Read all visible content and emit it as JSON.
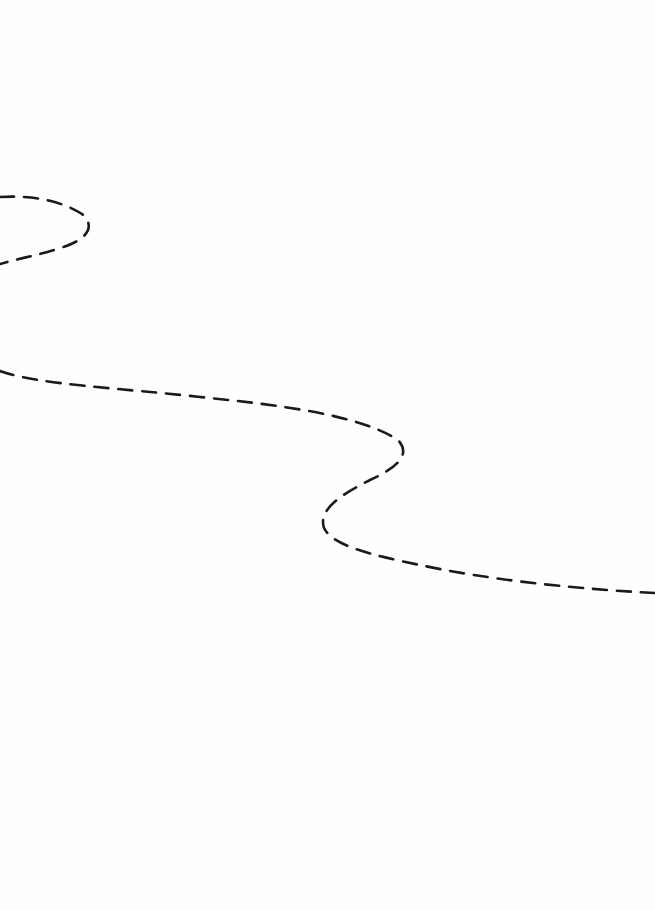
{
  "diagram": {
    "background": "#fefefe",
    "stroke_color": "#1a1a1a",
    "dash_pattern": "14 10",
    "curves": [
      {
        "name": "upper-left-loop",
        "path": "M 0 197 C 30 195, 60 200, 82 214 C 96 226, 88 240, 60 248 C 40 255, 20 258, 0 264"
      },
      {
        "name": "s-curve",
        "path": "M 0 371 C 40 385, 120 388, 200 397 C 280 405, 360 415, 398 440 C 412 455, 396 468, 370 480 C 340 495, 318 510, 324 528 C 332 545, 370 555, 420 565 C 480 578, 560 588, 655 593"
      }
    ]
  }
}
